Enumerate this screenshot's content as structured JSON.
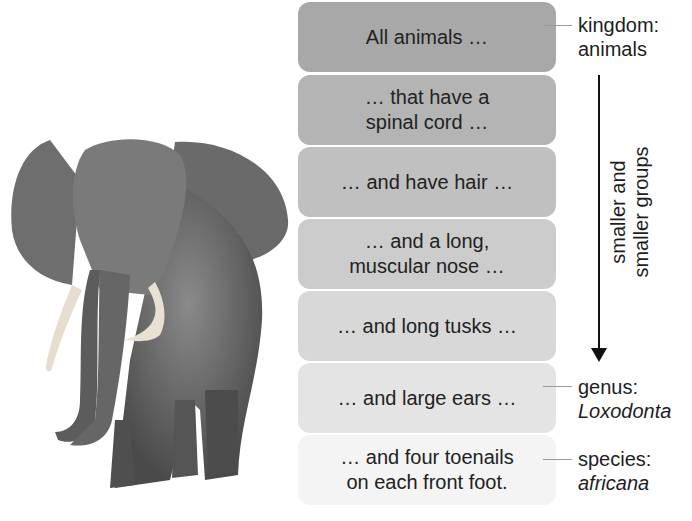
{
  "diagram": {
    "image": {
      "subject": "african-elephant-photo",
      "alt": "African elephant facing forward with tusks"
    },
    "boxes": [
      {
        "line1": "All animals …",
        "line2": "",
        "fill": "#a8a8a8"
      },
      {
        "line1": "… that have a",
        "line2": "spinal cord …",
        "fill": "#b4b4b4"
      },
      {
        "line1": "… and have hair …",
        "line2": "",
        "fill": "#c0c0c0"
      },
      {
        "line1": "… and a long,",
        "line2": "muscular nose …",
        "fill": "#cccccc"
      },
      {
        "line1": "… and long tusks …",
        "line2": "",
        "fill": "#d8d8d8"
      },
      {
        "line1": "… and large ears …",
        "line2": "",
        "fill": "#e4e4e4"
      },
      {
        "line1": "… and four toenails",
        "line2": "on each front foot.",
        "fill": "#f4f4f4"
      }
    ],
    "labels": {
      "kingdom": {
        "rank": "kingdom:",
        "name": "animals"
      },
      "genus": {
        "rank": "genus:",
        "name": "Loxodonta"
      },
      "species": {
        "rank": "species:",
        "name": "africana"
      }
    },
    "arrow": {
      "line1": "smaller and",
      "line2": "smaller groups",
      "direction": "down"
    }
  }
}
